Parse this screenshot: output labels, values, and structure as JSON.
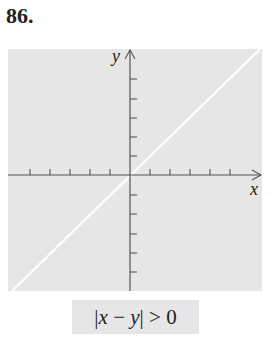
{
  "problem_number": "86.",
  "graph": {
    "x_axis_label": "x",
    "y_axis_label": "y",
    "region_fill_color": "#e6e6e6",
    "boundary_line_color": "#ffffff",
    "boundary_line": "y = x (excluded, dashed/white)",
    "x_ticks_each_side": 5,
    "y_ticks_each_side": 5
  },
  "caption": {
    "bar_left": "|",
    "var_x": "x",
    "minus": " − ",
    "var_y": "y",
    "bar_right": "|",
    "rest": " > 0",
    "full_text": "|x − y| > 0"
  }
}
